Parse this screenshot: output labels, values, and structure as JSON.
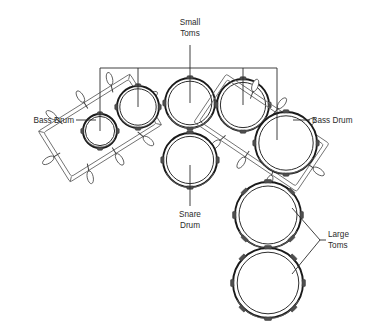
{
  "diagram": {
    "background_color": "#ffffff",
    "line_color": "#2b2b2b",
    "width": 373,
    "height": 333
  },
  "labels": {
    "small_toms": {
      "line1": "Small",
      "line2": "Toms"
    },
    "bass_drum_left": {
      "text": "Bass Drum"
    },
    "bass_drum_right": {
      "text": "Bass Drum"
    },
    "snare_drum": {
      "line1": "Snare",
      "line2": "Drum"
    },
    "large_toms": {
      "line1": "Large",
      "line2": "Toms"
    }
  },
  "components": [
    {
      "name": "bass-drum-left",
      "label": "Bass Drum",
      "shape": "tilted-cylinder",
      "cx": 100,
      "cy": 128,
      "size": 40
    },
    {
      "name": "small-tom-1",
      "label": "Small Toms",
      "shape": "circle",
      "cx": 100,
      "cy": 131,
      "r": 17
    },
    {
      "name": "small-tom-2",
      "label": "Small Toms",
      "shape": "circle",
      "cx": 138,
      "cy": 107,
      "r": 21
    },
    {
      "name": "small-tom-3",
      "label": "Small Toms",
      "shape": "circle",
      "cx": 190,
      "cy": 103,
      "r": 25
    },
    {
      "name": "small-tom-4",
      "label": "Small Toms",
      "shape": "circle",
      "cx": 243,
      "cy": 105,
      "r": 26
    },
    {
      "name": "bass-drum-right",
      "label": "Bass Drum",
      "shape": "circle",
      "cx": 286,
      "cy": 143,
      "r": 31
    },
    {
      "name": "snare-drum",
      "label": "Snare Drum",
      "shape": "circle",
      "cx": 190,
      "cy": 160,
      "r": 27
    },
    {
      "name": "large-tom-1",
      "label": "Large Toms",
      "shape": "circle",
      "cx": 268,
      "cy": 215,
      "r": 33
    },
    {
      "name": "large-tom-2",
      "label": "Large Toms",
      "shape": "circle",
      "cx": 268,
      "cy": 283,
      "r": 35
    }
  ]
}
